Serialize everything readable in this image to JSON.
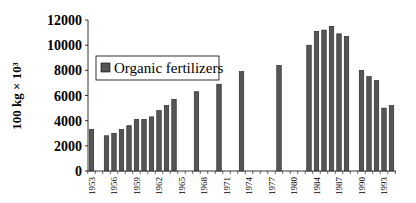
{
  "chart_data": {
    "type": "bar",
    "title": "",
    "xlabel": "",
    "ylabel": "100 kg × 10³",
    "ylim": [
      0,
      12000
    ],
    "yticks": [
      0,
      2000,
      4000,
      6000,
      8000,
      10000,
      12000
    ],
    "xtick_labels": [
      "1953",
      "1956",
      "1959",
      "1962",
      "1965",
      "1968",
      "1971",
      "1974",
      "1977",
      "1980",
      "1984",
      "1987",
      "1990",
      "1993"
    ],
    "grid": false,
    "legend_position": "upper-left-inside",
    "series": [
      {
        "name": "Organic fertilizers",
        "color": "#555555",
        "points": [
          {
            "year": "1953",
            "index": 0,
            "value": 3300
          },
          {
            "year": "1955",
            "index": 2,
            "value": 2800
          },
          {
            "year": "1956",
            "index": 3,
            "value": 3000
          },
          {
            "year": "1957",
            "index": 4,
            "value": 3300
          },
          {
            "year": "1958",
            "index": 5,
            "value": 3600
          },
          {
            "year": "1959",
            "index": 6,
            "value": 4100
          },
          {
            "year": "1960",
            "index": 7,
            "value": 4100
          },
          {
            "year": "1961",
            "index": 8,
            "value": 4300
          },
          {
            "year": "1962",
            "index": 9,
            "value": 4800
          },
          {
            "year": "1963",
            "index": 10,
            "value": 5200
          },
          {
            "year": "1964",
            "index": 11,
            "value": 5700
          },
          {
            "year": "1967",
            "index": 14,
            "value": 6300
          },
          {
            "year": "1970",
            "index": 17,
            "value": 6900
          },
          {
            "year": "1973",
            "index": 20,
            "value": 7900
          },
          {
            "year": "1978",
            "index": 25,
            "value": 8400
          },
          {
            "year": "1983",
            "index": 29,
            "value": 10000
          },
          {
            "year": "1984",
            "index": 30,
            "value": 11100
          },
          {
            "year": "1985",
            "index": 31,
            "value": 11200
          },
          {
            "year": "1986",
            "index": 32,
            "value": 11500
          },
          {
            "year": "1987",
            "index": 33,
            "value": 10900
          },
          {
            "year": "1988",
            "index": 34,
            "value": 10700
          },
          {
            "year": "1990",
            "index": 36,
            "value": 8000
          },
          {
            "year": "1991",
            "index": 37,
            "value": 7500
          },
          {
            "year": "1992",
            "index": 38,
            "value": 7200
          },
          {
            "year": "1993",
            "index": 39,
            "value": 5000
          },
          {
            "year": "1994",
            "index": 40,
            "value": 5200
          }
        ]
      }
    ],
    "xtick_label_indices": [
      0,
      3,
      6,
      9,
      12,
      15,
      18,
      21,
      24,
      27,
      30,
      33,
      36,
      39
    ],
    "n_slots": 41
  },
  "legend": {
    "label": "Organic fertilizers"
  },
  "axis": {
    "ylabel": "100 kg × 10³"
  }
}
